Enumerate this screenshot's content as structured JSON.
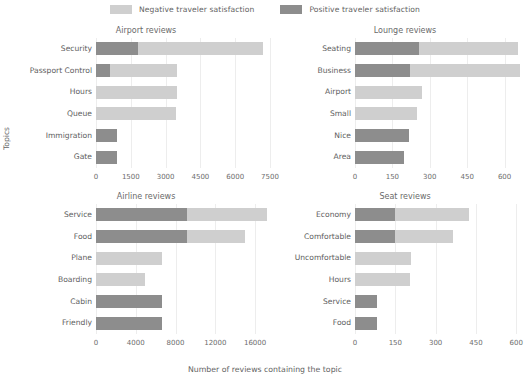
{
  "legend": {
    "items": [
      {
        "label": "Negative traveler satisfaction",
        "color": "#cfcfcf",
        "key": "negative"
      },
      {
        "label": "Positive traveler satisfaction",
        "color": "#8d8d8d",
        "key": "positive"
      }
    ]
  },
  "axes": {
    "ylabel": "Topics",
    "xlabel": "Number of reviews containing the topic"
  },
  "chart_data": {
    "type": "bar",
    "orientation": "horizontal",
    "stacked": true,
    "title": "",
    "xlabel": "Number of reviews containing the topic",
    "ylabel": "Topics",
    "grid": true,
    "legend_position": "top-center",
    "series_names": [
      "Positive traveler satisfaction",
      "Negative traveler satisfaction"
    ],
    "series_colors": {
      "positive": "#8d8d8d",
      "negative": "#cfcfcf"
    },
    "panels": [
      {
        "title": "Airport reviews",
        "position": "top-left",
        "categories": [
          "Security",
          "Passport Control",
          "Hours",
          "Queue",
          "Immigration",
          "Gate"
        ],
        "series": [
          {
            "name": "Positive traveler satisfaction",
            "values": [
              1800,
              600,
              0,
              0,
              900,
              900
            ]
          },
          {
            "name": "Negative traveler satisfaction",
            "values": [
              5400,
              2900,
              3500,
              3450,
              0,
              0
            ]
          }
        ],
        "totals": [
          7200,
          3500,
          3500,
          3450,
          900,
          900
        ],
        "xlim": [
          0,
          7500
        ],
        "xticks": [
          0,
          1500,
          3000,
          4500,
          6000,
          7500
        ],
        "xticklabels": [
          "0",
          "1500",
          "3000",
          "4500",
          "6000",
          "7500"
        ]
      },
      {
        "title": "Lounge reviews",
        "position": "top-right",
        "categories": [
          "Seating",
          "Business",
          "Airport",
          "Small",
          "Nice",
          "Area"
        ],
        "series": [
          {
            "name": "Positive traveler satisfaction",
            "values": [
              255,
              220,
              0,
              0,
              215,
              195
            ]
          },
          {
            "name": "Negative traveler satisfaction",
            "values": [
              400,
              440,
              270,
              250,
              0,
              0
            ]
          }
        ],
        "totals": [
          655,
          660,
          270,
          250,
          215,
          195
        ],
        "xlim": [
          0,
          690
        ],
        "xticks": [
          0,
          150,
          300,
          450,
          600
        ],
        "xticklabels": [
          "0",
          "150",
          "300",
          "450",
          "600"
        ]
      },
      {
        "title": "Airline reviews",
        "position": "bottom-left",
        "categories": [
          "Service",
          "Food",
          "Plane",
          "Boarding",
          "Cabin",
          "Friendly"
        ],
        "series": [
          {
            "name": "Positive traveler satisfaction",
            "values": [
              9200,
              9200,
              0,
              0,
              6600,
              6600
            ]
          },
          {
            "name": "Negative traveler satisfaction",
            "values": [
              8000,
              5800,
              6600,
              4900,
              0,
              0
            ]
          }
        ],
        "totals": [
          17200,
          15000,
          6600,
          4900,
          6600,
          6600
        ],
        "xlim": [
          0,
          17500
        ],
        "xticks": [
          0,
          4000,
          8000,
          12000,
          16000
        ],
        "xticklabels": [
          "0",
          "4000",
          "8000",
          "12000",
          "16000"
        ]
      },
      {
        "title": "Seat reviews",
        "position": "bottom-right",
        "categories": [
          "Economy",
          "Comfortable",
          "Uncomfortable",
          "Hours",
          "Service",
          "Food"
        ],
        "series": [
          {
            "name": "Positive traveler satisfaction",
            "values": [
              150,
              150,
              0,
              0,
              80,
              80
            ]
          },
          {
            "name": "Negative traveler satisfaction",
            "values": [
              275,
              215,
              210,
              205,
              0,
              0
            ]
          }
        ],
        "totals": [
          425,
          365,
          210,
          205,
          80,
          80
        ],
        "xlim": [
          0,
          640
        ],
        "xticks": [
          0,
          150,
          300,
          450,
          600
        ],
        "xticklabels": [
          "0",
          "150",
          "300",
          "450",
          "600"
        ]
      }
    ]
  }
}
